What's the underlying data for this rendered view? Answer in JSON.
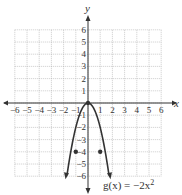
{
  "chart_data": {
    "type": "line",
    "title": "",
    "xlabel": "x",
    "ylabel": "y",
    "xlim": [
      -6,
      6
    ],
    "ylim": [
      -6,
      6
    ],
    "grid": true,
    "x_ticks": [
      "-6",
      "-5",
      "-4",
      "-3",
      "-2",
      "-1",
      "1",
      "2",
      "3",
      "4",
      "5",
      "6"
    ],
    "y_ticks": [
      "6",
      "5",
      "4",
      "3",
      "2",
      "1",
      "-1",
      "-2",
      "-3",
      "-4",
      "-5",
      "-6"
    ],
    "series": [
      {
        "name": "g(x) = -2x^2",
        "label": "g(x) = −2x²",
        "function": "-2*x^2",
        "x": [
          -1.75,
          -1.5,
          -1,
          -0.5,
          0,
          0.5,
          1,
          1.5,
          1.75
        ],
        "y": [
          -6.125,
          -4.5,
          -2,
          -0.5,
          0,
          -0.5,
          -2,
          -4.5,
          -6.125
        ],
        "marked_points": [
          {
            "x": -1,
            "y": -4
          },
          {
            "x": 0,
            "y": 0
          },
          {
            "x": 1,
            "y": -4
          }
        ],
        "color": "#333333"
      }
    ],
    "annotations": [
      {
        "text": "g(x) = −2x²",
        "position": "bottom-right of curve"
      }
    ]
  },
  "labels": {
    "x_axis": "x",
    "y_axis": "y",
    "equation_prefix": "g(x) = −2x",
    "equation_exp": "2"
  }
}
